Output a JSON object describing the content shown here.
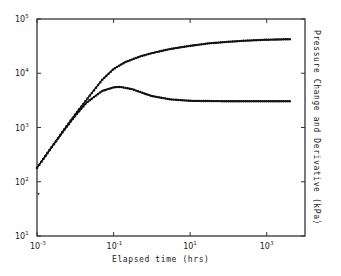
{
  "chart_data": {
    "type": "line",
    "title": "",
    "xlabel": "Elapsed time (hrs)",
    "ylabel": "Pressure Change and Derivative (kPa)",
    "xscale": "log",
    "yscale": "log",
    "xlim": [
      0.001,
      10000
    ],
    "ylim": [
      10,
      100000
    ],
    "x_ticks": [
      {
        "value": 0.001,
        "base": "10",
        "exp": "-3"
      },
      {
        "value": 0.1,
        "base": "10",
        "exp": "-1"
      },
      {
        "value": 10,
        "base": "10",
        "exp": "1"
      },
      {
        "value": 1000,
        "base": "10",
        "exp": "3"
      }
    ],
    "y_ticks": [
      {
        "value": 10,
        "base": "10",
        "exp": "1"
      },
      {
        "value": 100,
        "base": "10",
        "exp": "2"
      },
      {
        "value": 1000,
        "base": "10",
        "exp": "3"
      },
      {
        "value": 10000,
        "base": "10",
        "exp": "4"
      },
      {
        "value": 100000,
        "base": "10",
        "exp": "5"
      }
    ],
    "grid": false,
    "legend": "none",
    "series": [
      {
        "name": "Pressure change",
        "x": [
          0.001,
          0.002,
          0.005,
          0.01,
          0.02,
          0.05,
          0.1,
          0.2,
          0.5,
          1,
          3,
          10,
          30,
          100,
          300,
          1000,
          4000
        ],
        "y": [
          180,
          360,
          900,
          1750,
          3300,
          7500,
          12000,
          16000,
          20500,
          23500,
          28000,
          32000,
          35500,
          38000,
          40000,
          41500,
          42500
        ]
      },
      {
        "name": "Pressure derivative",
        "x": [
          0.001,
          0.002,
          0.005,
          0.01,
          0.02,
          0.05,
          0.1,
          0.15,
          0.3,
          0.5,
          1,
          3,
          10,
          100,
          1000,
          4000
        ],
        "y": [
          180,
          360,
          880,
          1650,
          2900,
          4700,
          5500,
          5600,
          5100,
          4500,
          3800,
          3300,
          3100,
          3050,
          3050,
          3050
        ]
      }
    ],
    "annotations": [
      {
        "type": "stray-point",
        "x": 0.0011,
        "y": 60
      }
    ]
  }
}
